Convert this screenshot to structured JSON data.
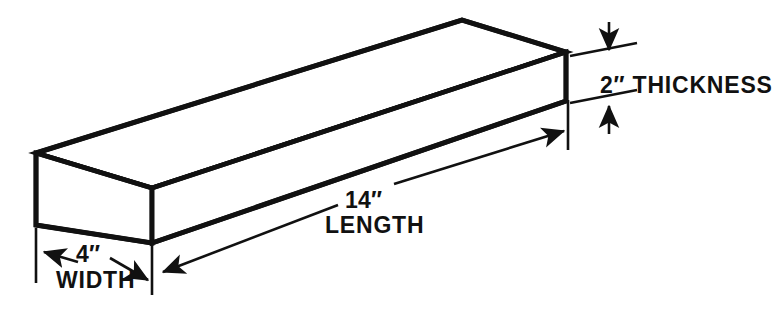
{
  "figure": {
    "background_color": "#ffffff",
    "line_color": "#111111",
    "units": "inches"
  },
  "object": {
    "shape_name": "rectangular-block",
    "description": "Isometric view of a rectangular solid (board / billet)"
  },
  "dimensions": {
    "length": {
      "value_text": "14″",
      "label": "LENGTH",
      "number": 14,
      "unit": "in"
    },
    "width": {
      "value_text": "4″",
      "label": "WIDTH",
      "number": 4,
      "unit": "in"
    },
    "thickness": {
      "value_text": "2″ THICKNESS",
      "label": "THICKNESS",
      "number": 2,
      "unit": "in"
    }
  }
}
